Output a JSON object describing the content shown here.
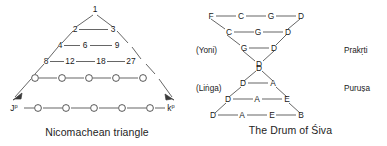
{
  "figure": {
    "panels": [
      {
        "id": "nicomachean",
        "caption": "Nicomachean triangle",
        "end_labels": {
          "left_base": "J",
          "left_base_sup": "p",
          "right_base": "k",
          "right_base_sup": "p"
        },
        "rows": [
          {
            "index": 1,
            "values": [
              "1"
            ]
          },
          {
            "index": 2,
            "values": [
              "2",
              "3"
            ]
          },
          {
            "index": 3,
            "values": [
              "4",
              "6",
              "9"
            ]
          },
          {
            "index": 4,
            "values": [
              "8",
              "12",
              "18",
              "27"
            ]
          },
          {
            "index": 5,
            "values": [
              "o",
              "o",
              "o",
              "o",
              "o"
            ]
          },
          {
            "index": 6,
            "values": [
              "o",
              "o",
              "o",
              "o",
              "o"
            ]
          }
        ]
      },
      {
        "id": "drum-of-siva",
        "caption": "The Drum of Śiva",
        "side_labels": {
          "upper_left": "(Yoni)",
          "upper_right": "Prakṛti",
          "lower_left": "(Liṅga)",
          "lower_right": "Puruṣa"
        },
        "upper_triangle_rows": [
          {
            "index": 1,
            "values": [
              "F",
              "C",
              "G",
              "D"
            ]
          },
          {
            "index": 2,
            "values": [
              "C",
              "G",
              "D"
            ]
          },
          {
            "index": 3,
            "values": [
              "G",
              "D"
            ]
          },
          {
            "index": 4,
            "values": [
              "D"
            ]
          }
        ],
        "lower_triangle_rows": [
          {
            "index": 1,
            "values": [
              "D"
            ]
          },
          {
            "index": 2,
            "values": [
              "D",
              "A"
            ]
          },
          {
            "index": 3,
            "values": [
              "D",
              "A",
              "E"
            ]
          },
          {
            "index": 4,
            "values": [
              "D",
              "A",
              "E",
              "B"
            ]
          }
        ]
      }
    ]
  }
}
